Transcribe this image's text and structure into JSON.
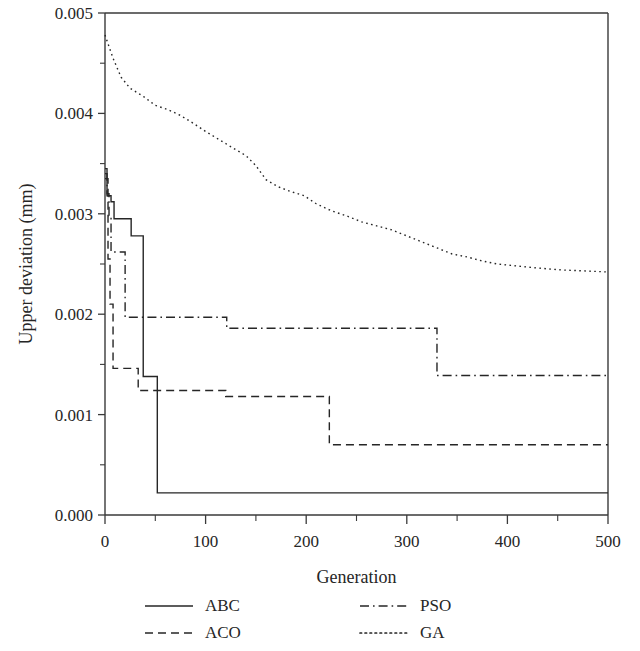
{
  "chart_data": {
    "type": "line",
    "title": "",
    "xlabel": "Generation",
    "ylabel": "Upper deviation (mm)",
    "xlim": [
      0,
      500
    ],
    "ylim": [
      0.0,
      0.005
    ],
    "xticks": [
      0,
      100,
      200,
      300,
      400,
      500
    ],
    "xticklabels": [
      "0",
      "100",
      "200",
      "300",
      "400",
      "500"
    ],
    "yticks": [
      0.0,
      0.001,
      0.002,
      0.003,
      0.004,
      0.005
    ],
    "yticklabels": [
      "0.000",
      "0.001",
      "0.002",
      "0.003",
      "0.004",
      "0.005"
    ],
    "yminorticks": [
      0.0005,
      0.0015,
      0.0025,
      0.0035,
      0.0045
    ],
    "grid": false,
    "legend_position": "below-axes",
    "series": [
      {
        "name": "ABC",
        "linestyle": "solid",
        "color": "#262626",
        "points": [
          [
            0,
            0.00345
          ],
          [
            2,
            0.00345
          ],
          [
            2,
            0.00318
          ],
          [
            6,
            0.00318
          ],
          [
            6,
            0.00312
          ],
          [
            9,
            0.00312
          ],
          [
            9,
            0.00295
          ],
          [
            26,
            0.00295
          ],
          [
            26,
            0.00278
          ],
          [
            38,
            0.00278
          ],
          [
            38,
            0.00138
          ],
          [
            52,
            0.00138
          ],
          [
            52,
            0.00022
          ],
          [
            500,
            0.00022
          ]
        ]
      },
      {
        "name": "ACO",
        "linestyle": "dashed",
        "color": "#262626",
        "points": [
          [
            0,
            0.00335
          ],
          [
            3,
            0.00335
          ],
          [
            3,
            0.00255
          ],
          [
            5,
            0.00255
          ],
          [
            5,
            0.0021
          ],
          [
            8,
            0.0021
          ],
          [
            8,
            0.00146
          ],
          [
            33,
            0.00146
          ],
          [
            33,
            0.00124
          ],
          [
            120,
            0.00124
          ],
          [
            120,
            0.00118
          ],
          [
            223,
            0.00118
          ],
          [
            223,
            0.0007
          ],
          [
            500,
            0.0007
          ]
        ]
      },
      {
        "name": "PSO",
        "linestyle": "dashdot",
        "color": "#262626",
        "points": [
          [
            0,
            0.0034
          ],
          [
            2,
            0.0034
          ],
          [
            2,
            0.0032
          ],
          [
            4,
            0.0032
          ],
          [
            4,
            0.00298
          ],
          [
            6,
            0.00298
          ],
          [
            6,
            0.00262
          ],
          [
            20,
            0.00262
          ],
          [
            20,
            0.00197
          ],
          [
            121,
            0.00197
          ],
          [
            121,
            0.00186
          ],
          [
            330,
            0.00186
          ],
          [
            330,
            0.00139
          ],
          [
            500,
            0.00139
          ]
        ]
      },
      {
        "name": "GA",
        "linestyle": "dotted",
        "color": "#262626",
        "points": [
          [
            0,
            0.00478
          ],
          [
            8,
            0.00455
          ],
          [
            16,
            0.00436
          ],
          [
            25,
            0.00425
          ],
          [
            38,
            0.00417
          ],
          [
            50,
            0.00408
          ],
          [
            62,
            0.00404
          ],
          [
            75,
            0.00398
          ],
          [
            88,
            0.0039
          ],
          [
            100,
            0.00382
          ],
          [
            115,
            0.00373
          ],
          [
            128,
            0.00365
          ],
          [
            140,
            0.00358
          ],
          [
            150,
            0.00348
          ],
          [
            160,
            0.00334
          ],
          [
            172,
            0.00327
          ],
          [
            185,
            0.00322
          ],
          [
            198,
            0.00318
          ],
          [
            210,
            0.0031
          ],
          [
            225,
            0.00303
          ],
          [
            240,
            0.00298
          ],
          [
            255,
            0.00292
          ],
          [
            270,
            0.00288
          ],
          [
            285,
            0.00284
          ],
          [
            300,
            0.00278
          ],
          [
            315,
            0.00272
          ],
          [
            330,
            0.00266
          ],
          [
            345,
            0.0026
          ],
          [
            360,
            0.00257
          ],
          [
            375,
            0.00253
          ],
          [
            390,
            0.0025
          ],
          [
            410,
            0.00248
          ],
          [
            430,
            0.00246
          ],
          [
            455,
            0.00244
          ],
          [
            480,
            0.00243
          ],
          [
            500,
            0.00242
          ]
        ]
      }
    ]
  },
  "legend": {
    "entries": [
      {
        "label": "ABC",
        "style": "solid"
      },
      {
        "label": "PSO",
        "style": "dashdot"
      },
      {
        "label": "ACO",
        "style": "dashed"
      },
      {
        "label": "GA",
        "style": "dotted"
      }
    ]
  }
}
